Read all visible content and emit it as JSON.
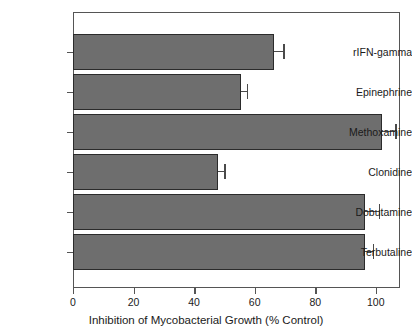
{
  "chart_data": {
    "type": "bar",
    "orientation": "horizontal",
    "title": "",
    "xlabel": "Inhibition of Mycobacterial Growth (% Control)",
    "ylabel": "",
    "xlim": [
      0,
      108
    ],
    "xticks": [
      0,
      20,
      40,
      60,
      80,
      100
    ],
    "grid": false,
    "legend": null,
    "bar_color": "#6e6e6e",
    "bar_edge_color": "#2b2b2b",
    "categories": [
      "rIFN-gamma",
      "Epinephrine",
      "Methoxamine",
      "Clonidine",
      "Dobutamine",
      "Terbutaline"
    ],
    "values": [
      66.5,
      55.5,
      102.0,
      48.0,
      96.5,
      96.5
    ],
    "errors": [
      3.0,
      2.0,
      4.5,
      2.0,
      4.5,
      2.5
    ],
    "error_direction": "positive"
  },
  "axis": {
    "x_tick_labels": [
      "0",
      "20",
      "40",
      "60",
      "80",
      "100"
    ],
    "x_title": "Inhibition of Mycobacterial Growth (% Control)"
  }
}
